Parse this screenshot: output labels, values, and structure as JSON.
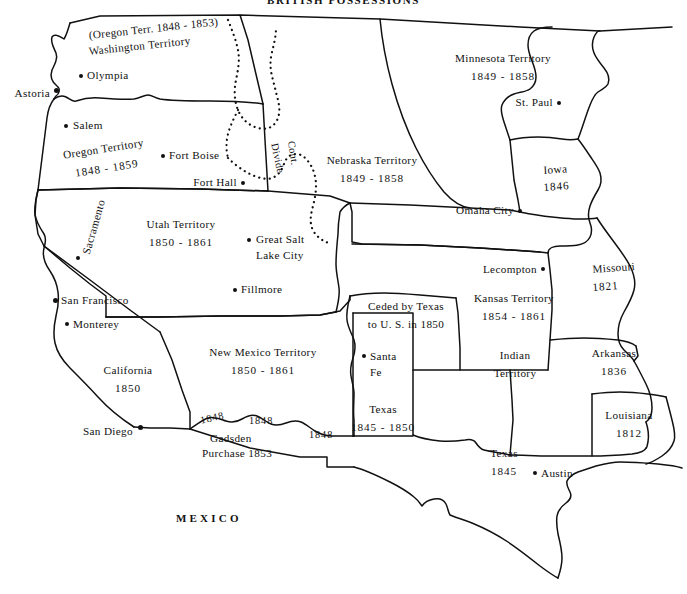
{
  "map": {
    "title": "BRITISH POSSESSIONS",
    "country_label": "MEXICO",
    "divide_line1": "Cont.",
    "divide_line2": "Divide",
    "width": 687,
    "height": 594,
    "ink_color": "#111111",
    "background_color": "#ffffff"
  },
  "territories": [
    {
      "id": "washington",
      "name_line1": "(Oregon Terr.  1848 - 1853)",
      "name_line2": "Washington Territory",
      "years": ""
    },
    {
      "id": "oregon",
      "name_line1": "Oregon  Territory",
      "name_line2": "",
      "years": "1848 - 1859"
    },
    {
      "id": "minnesota",
      "name_line1": "Minnesota  Territory",
      "name_line2": "",
      "years": "1849 - 1858"
    },
    {
      "id": "nebraska",
      "name_line1": "Nebraska  Territory",
      "name_line2": "",
      "years": "1849 - 1858"
    },
    {
      "id": "utah",
      "name_line1": "Utah  Territory",
      "name_line2": "",
      "years": "1850 - 1861"
    },
    {
      "id": "new-mexico",
      "name_line1": "New  Mexico  Territory",
      "name_line2": "",
      "years": "1850 - 1861"
    },
    {
      "id": "kansas",
      "name_line1": "Kansas  Territory",
      "name_line2": "",
      "years": "1854 - 1861"
    },
    {
      "id": "indian",
      "name_line1": "Indian",
      "name_line2": "Territory",
      "years": ""
    },
    {
      "id": "iowa",
      "name_line1": "Iowa",
      "name_line2": "",
      "years": "1846"
    },
    {
      "id": "missouri",
      "name_line1": "Missouri",
      "name_line2": "",
      "years": "1821"
    },
    {
      "id": "arkansas",
      "name_line1": "Arkansas",
      "name_line2": "",
      "years": "1836"
    },
    {
      "id": "louisiana",
      "name_line1": "Louisiana",
      "name_line2": "",
      "years": "1812"
    },
    {
      "id": "california",
      "name_line1": "California",
      "name_line2": "",
      "years": "1850"
    },
    {
      "id": "texas-state",
      "name_line1": "Texas",
      "name_line2": "",
      "years": "1845"
    },
    {
      "id": "texas-claim",
      "name_line1": "Texas",
      "name_line2": "",
      "years": "1845 - 1850"
    }
  ],
  "annotations": [
    {
      "id": "ceded-by-texas",
      "line1": "Ceded by Texas",
      "line2": "to U. S. in 1850"
    },
    {
      "id": "gadsden",
      "line1": "Gadsden",
      "line2": "Purchase  1853"
    }
  ],
  "border_years": [
    {
      "id": "border-1848-west",
      "value": "1848"
    },
    {
      "id": "border-1848-mid",
      "value": "1848"
    },
    {
      "id": "border-1848-east",
      "value": "1848"
    }
  ],
  "cities": [
    {
      "id": "olympia",
      "name": "Olympia",
      "label_side": "right"
    },
    {
      "id": "astoria",
      "name": "Astoria",
      "label_side": "left"
    },
    {
      "id": "salem",
      "name": "Salem",
      "label_side": "right"
    },
    {
      "id": "fort-boise",
      "name": "Fort Boise",
      "label_side": "right"
    },
    {
      "id": "fort-hall",
      "name": "Fort Hall",
      "label_side": "left"
    },
    {
      "id": "st-paul",
      "name": "St. Paul",
      "label_side": "left"
    },
    {
      "id": "omaha-city",
      "name": "Omaha City",
      "label_side": "left"
    },
    {
      "id": "sacramento",
      "name": "Sacramento",
      "label_side": "rotated"
    },
    {
      "id": "san-francisco",
      "name": "San Francisco",
      "label_side": "right"
    },
    {
      "id": "monterey",
      "name": "Monterey",
      "label_side": "right"
    },
    {
      "id": "san-diego",
      "name": "San Diego",
      "label_side": "left"
    },
    {
      "id": "great-salt-lake-city",
      "name_line1": "Great Salt",
      "name_line2": "Lake City",
      "label_side": "right"
    },
    {
      "id": "fillmore",
      "name": "Fillmore",
      "label_side": "right"
    },
    {
      "id": "lecompton",
      "name": "Lecompton",
      "label_side": "left"
    },
    {
      "id": "santa-fe",
      "name_line1": "Santa",
      "name_line2": "Fe",
      "label_side": "right"
    },
    {
      "id": "austin",
      "name": "Austin",
      "label_side": "right"
    }
  ]
}
